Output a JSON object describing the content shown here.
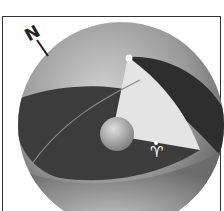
{
  "diagram": {
    "type": "celestial-sphere",
    "labels": {
      "north": "N",
      "vernal_equinox_symbol": "♈"
    },
    "elements": [
      "outer-celestial-sphere",
      "north-pole-axis-marker",
      "celestial-pole-point",
      "hour-angle-wedge",
      "central-earth-sphere",
      "equator-band",
      "ecliptic-line",
      "vernal-equinox-point"
    ],
    "colors": {
      "sphere_light": "#c8c8c8",
      "sphere_dark": "#5a5a5a",
      "band_dark": "#3a3a3a",
      "wedge": "#e6e6e6",
      "frame": "#333333"
    }
  }
}
